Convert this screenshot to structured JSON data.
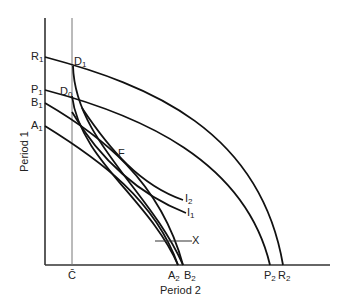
{
  "diagram": {
    "type": "intertemporal production/consumption frontier diagram",
    "axes": {
      "x_label": "Period 2",
      "y_label": "Period 1"
    },
    "y_axis_labels": [
      {
        "main": "R",
        "sub": "1"
      },
      {
        "main": "P",
        "sub": "1"
      },
      {
        "main": "B",
        "sub": "1"
      },
      {
        "main": "A",
        "sub": "1"
      }
    ],
    "x_axis_labels": [
      {
        "main": "C̄",
        "sub": ""
      },
      {
        "main": "A",
        "sub": "2"
      },
      {
        "main": "B",
        "sub": "2"
      },
      {
        "main": "P",
        "sub": "2"
      },
      {
        "main": "R",
        "sub": "2"
      }
    ],
    "points": [
      {
        "main": "D",
        "sub": "1"
      },
      {
        "main": "D",
        "sub": "0"
      },
      {
        "main": "F",
        "sub": ""
      }
    ],
    "curves": [
      {
        "main": "I",
        "sub": "2"
      },
      {
        "main": "I",
        "sub": "1"
      }
    ],
    "marker": "X"
  }
}
